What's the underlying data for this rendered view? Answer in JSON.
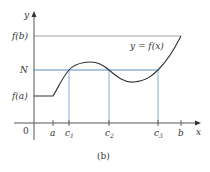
{
  "figure": {
    "caption": "(b)",
    "curve_label": "y = f(x)",
    "axes": {
      "x_label": "x",
      "y_label": "y",
      "origin_label": "0"
    },
    "y_ticks": [
      {
        "label": "f(b)",
        "y": 36
      },
      {
        "label": "N",
        "y": 70
      },
      {
        "label": "f(a)",
        "y": 96
      }
    ],
    "x_ticks": [
      {
        "label": "a",
        "x": 53
      },
      {
        "label": "c",
        "sub": "1",
        "x": 69
      },
      {
        "label": "c",
        "sub": "2",
        "x": 109
      },
      {
        "label": "c",
        "sub": "3",
        "x": 158
      },
      {
        "label": "b",
        "x": 181
      }
    ],
    "colors": {
      "axis": "#444444",
      "curve": "#333333",
      "n_line": "#5b8fc7",
      "fb_line": "#888888",
      "drop_lines": "#7aa7d6"
    }
  }
}
